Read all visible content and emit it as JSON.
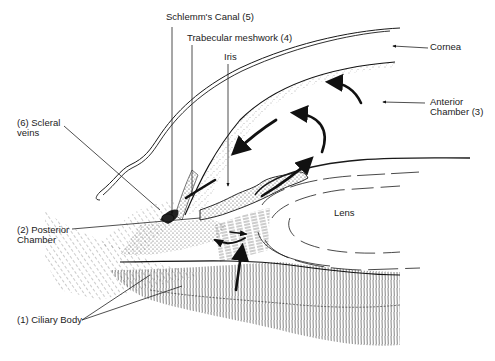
{
  "diagram": {
    "colors": {
      "ink": "#1a1a1a",
      "background": "#ffffff",
      "stipple": "#555555"
    },
    "labels": {
      "schlemms_canal": "Schlemm's Canal (5)",
      "trabecular_meshwork": "Trabecular meshwork (4)",
      "iris": "Iris",
      "cornea": "Cornea",
      "anterior_chamber_line1": "Anterior",
      "anterior_chamber_line2": "Chamber (3)",
      "scleral_veins_line1": "(6)  Scleral",
      "scleral_veins_line2": "veins",
      "posterior_chamber_line1": "(2)  Posterior",
      "posterior_chamber_line2": "Chamber",
      "lens": "Lens",
      "ciliary_body": "(1) Ciliary Body"
    },
    "flow_arrows": [
      "ciliary body -> posterior chamber",
      "posterior chamber -> through pupil -> anterior chamber",
      "anterior chamber circulation",
      "anterior chamber -> trabecular meshwork -> Schlemm's canal"
    ]
  }
}
